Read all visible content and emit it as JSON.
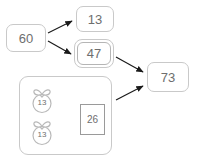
{
  "diagram": {
    "background_color": "#ffffff",
    "node_border_color": "#c9c9c9",
    "text_color": "#6e6e6e",
    "arrow_color": "#1a1a1a"
  },
  "nodes": {
    "source": {
      "value": "60",
      "shape": "rounded-rect"
    },
    "part_a": {
      "value": "13",
      "shape": "rounded-rect"
    },
    "part_b": {
      "value": "47",
      "shape": "double-rounded-rect"
    },
    "total": {
      "value": "73",
      "shape": "rounded-rect"
    },
    "sum": {
      "value": "26",
      "shape": "square"
    }
  },
  "group": {
    "label": "bag-group",
    "bags": [
      {
        "value": "13",
        "icon": "gift-bag-icon"
      },
      {
        "value": "13",
        "icon": "gift-bag-icon"
      }
    ]
  },
  "edges": [
    {
      "from": "60",
      "to": "13",
      "type": "arrow"
    },
    {
      "from": "60",
      "to": "47",
      "type": "arrow"
    },
    {
      "from": "47",
      "to": "73",
      "type": "arrow"
    },
    {
      "from": "bag-1",
      "to": "26",
      "type": "arrow"
    },
    {
      "from": "bag-2",
      "to": "26",
      "type": "arrow"
    },
    {
      "from": "bag-group",
      "to": "73",
      "type": "arrow"
    }
  ]
}
